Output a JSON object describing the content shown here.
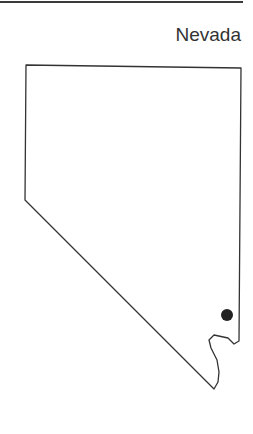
{
  "map": {
    "title": "Nevada",
    "region": "Nevada state outline",
    "marker": {
      "type": "dot",
      "color": "#222222"
    },
    "outline_color": "#333333"
  }
}
